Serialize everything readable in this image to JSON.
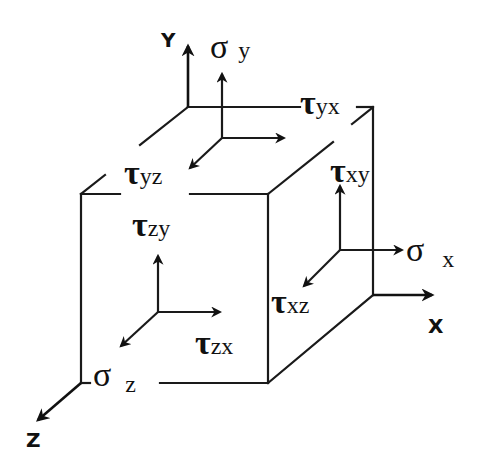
{
  "diagram": {
    "axes": {
      "x": {
        "label": "X"
      },
      "y": {
        "label": "Y"
      },
      "z": {
        "label": "Z"
      }
    },
    "faces": {
      "y_face": {
        "normal": {
          "symbol": "σ",
          "subscript": "y"
        },
        "shear_1": {
          "symbol": "τ",
          "subscript": "yx"
        },
        "shear_2": {
          "symbol": "τ",
          "subscript": "yz"
        }
      },
      "x_face": {
        "normal": {
          "symbol": "σ",
          "subscript": "x"
        },
        "shear_1": {
          "symbol": "τ",
          "subscript": "xy"
        },
        "shear_2": {
          "symbol": "τ",
          "subscript": "xz"
        }
      },
      "z_face": {
        "normal": {
          "symbol": "σ",
          "subscript": "z"
        },
        "shear_1": {
          "symbol": "τ",
          "subscript": "zy"
        },
        "shear_2": {
          "symbol": "τ",
          "subscript": "zx"
        }
      }
    },
    "colors": {
      "line": "#1a1a1a",
      "background": "#ffffff"
    }
  }
}
